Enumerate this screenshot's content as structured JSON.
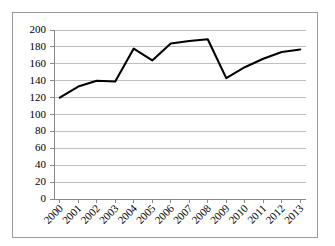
{
  "chart_data": {
    "type": "line",
    "title": "",
    "subtitle": "",
    "xlabel": "",
    "ylabel": "",
    "categories": [
      "2000",
      "2001",
      "2002",
      "2003",
      "2004",
      "2005",
      "2006",
      "2007",
      "2008",
      "2009",
      "2010",
      "2011",
      "2012",
      "2013"
    ],
    "values": [
      120,
      133,
      140,
      139,
      178,
      164,
      184,
      187,
      189,
      143,
      156,
      166,
      174,
      177
    ],
    "series": [
      {
        "name": "",
        "values": [
          120,
          133,
          140,
          139,
          178,
          164,
          184,
          187,
          189,
          143,
          156,
          166,
          174,
          177
        ]
      }
    ],
    "ylim": [
      0,
      200
    ],
    "ytick_values": [
      0,
      20,
      40,
      60,
      80,
      100,
      120,
      140,
      160,
      180,
      200
    ],
    "ytick_labels": [
      "0",
      "20",
      "40",
      "60",
      "80",
      "100",
      "120",
      "140",
      "160",
      "180",
      "200"
    ],
    "xtick_labels": [
      "2000",
      "2001",
      "2002",
      "2003",
      "2004",
      "2005",
      "2006",
      "2007",
      "2008",
      "2009",
      "2010",
      "2011",
      "2012",
      "2013"
    ],
    "grid": true,
    "grid_axis": "y",
    "legend": false,
    "legend_position": "none",
    "line_color": "#000000",
    "grid_color": "#bfbfbf",
    "axis_color": "#8a8a8a",
    "background_color": "#ffffff",
    "xtick_label_rotation": -45,
    "markers": false
  }
}
